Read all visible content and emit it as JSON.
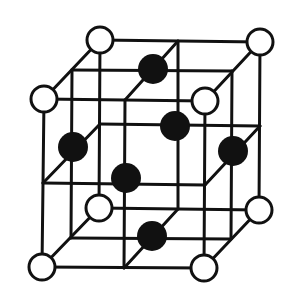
{
  "diagram": {
    "type": "crystal-lattice",
    "colors": {
      "line": "#111111",
      "open_atom_fill": "#ffffff",
      "filled_atom": "#111111",
      "background": "#ffffff"
    },
    "line_width": 3,
    "open_radius": 13,
    "filled_radius": 15,
    "corner_atoms": [
      {
        "id": "back-top-left",
        "x": 100,
        "y": 40
      },
      {
        "id": "back-top-right",
        "x": 260,
        "y": 42
      },
      {
        "id": "front-top-left",
        "x": 44,
        "y": 99
      },
      {
        "id": "front-top-right",
        "x": 205,
        "y": 101
      },
      {
        "id": "back-bottom-left",
        "x": 99,
        "y": 208
      },
      {
        "id": "back-bottom-right",
        "x": 259,
        "y": 210
      },
      {
        "id": "front-bottom-left",
        "x": 42,
        "y": 267
      },
      {
        "id": "front-bottom-right",
        "x": 204,
        "y": 268
      }
    ],
    "face_atoms": [
      {
        "id": "top-face",
        "x": 153,
        "y": 69
      },
      {
        "id": "back-face",
        "x": 175,
        "y": 126
      },
      {
        "id": "left-face",
        "x": 73,
        "y": 147
      },
      {
        "id": "right-face",
        "x": 233,
        "y": 151
      },
      {
        "id": "front-face",
        "x": 126,
        "y": 178
      },
      {
        "id": "bottom-face",
        "x": 152,
        "y": 236
      }
    ]
  }
}
